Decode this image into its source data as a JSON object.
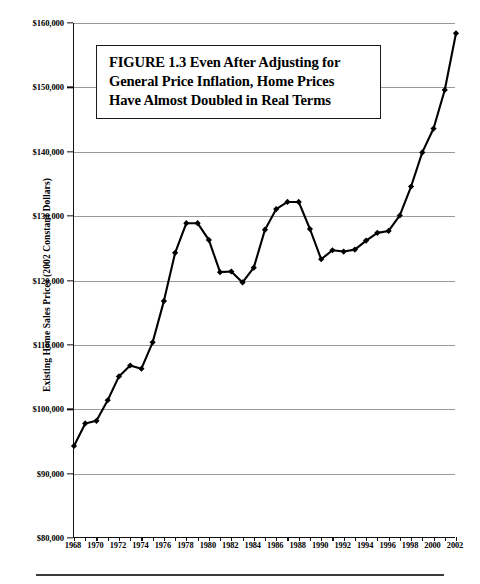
{
  "chart_data": {
    "type": "line",
    "title": "FIGURE 1.3  Even After Adjusting for General Price Inflation, Home Prices Have Almost Doubled in Real Terms",
    "title_lines": [
      "FIGURE 1.3  Even After Adjusting for",
      "General Price Inflation, Home Prices",
      "Have Almost Doubled in Real Terms"
    ],
    "xlabel": "",
    "ylabel": "Existing Home Sales Prices (2002 Constant Dollars)",
    "ylim": [
      80000,
      160000
    ],
    "xlim": [
      1968,
      2002
    ],
    "grid": "horizontal",
    "legend": "none",
    "line_color": "#000000",
    "marker": "diamond",
    "ytick_labels": [
      "$160,000",
      "$150,000",
      "$140,000",
      "$130,000",
      "$120,000",
      "$110,000",
      "$100,000",
      "$90,000",
      "$80,000"
    ],
    "ytick_values": [
      160000,
      150000,
      140000,
      130000,
      120000,
      110000,
      100000,
      90000,
      80000
    ],
    "xtick_labels": [
      "1968",
      "1970",
      "1972",
      "1974",
      "1976",
      "1978",
      "1980",
      "1982",
      "1984",
      "1986",
      "1988",
      "1990",
      "1992",
      "1994",
      "1996",
      "1998",
      "2000",
      "2002"
    ],
    "xtick_values": [
      1968,
      1970,
      1972,
      1974,
      1976,
      1978,
      1980,
      1982,
      1984,
      1986,
      1988,
      1990,
      1992,
      1994,
      1996,
      1998,
      2000,
      2002
    ],
    "x": [
      1968,
      1969,
      1970,
      1971,
      1972,
      1973,
      1974,
      1975,
      1976,
      1977,
      1978,
      1979,
      1980,
      1981,
      1982,
      1983,
      1984,
      1985,
      1986,
      1987,
      1988,
      1989,
      1990,
      1991,
      1992,
      1993,
      1994,
      1995,
      1996,
      1997,
      1998,
      1999,
      2000,
      2001,
      2002
    ],
    "values": [
      94300,
      97800,
      98200,
      101400,
      105100,
      106800,
      106300,
      110400,
      116800,
      124300,
      128900,
      128900,
      126300,
      121300,
      121400,
      119700,
      122000,
      127900,
      131100,
      132200,
      132200,
      128000,
      123300,
      124700,
      124500,
      124800,
      126200,
      127400,
      127700,
      130100,
      134600,
      139900,
      143600,
      149600,
      158400
    ],
    "series": [
      {
        "name": "Existing Home Sales Prices (2002 Constant Dollars)",
        "values": [
          94300,
          97800,
          98200,
          101400,
          105100,
          106800,
          106300,
          110400,
          116800,
          124300,
          128900,
          128900,
          126300,
          121300,
          121400,
          119700,
          122000,
          127900,
          131100,
          132200,
          132200,
          128000,
          123300,
          124700,
          124500,
          124800,
          126200,
          127400,
          127700,
          130100,
          134600,
          139900,
          143600,
          149600,
          158400
        ]
      }
    ]
  }
}
